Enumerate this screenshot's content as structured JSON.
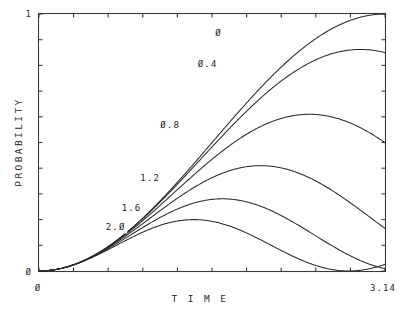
{
  "chart_data": {
    "type": "line",
    "title": "",
    "xlabel": "T I M E",
    "ylabel": "PROBABILITY",
    "xlim": [
      0,
      3.14
    ],
    "ylim": [
      0,
      1
    ],
    "x_tick_labels": [
      "Ø",
      "3.14"
    ],
    "y_tick_labels": [
      "Ø",
      "1"
    ],
    "x_minor_ticks": 10,
    "y_minor_ticks": 10,
    "grid": false,
    "legend_position": "inline-curve-labels",
    "legend_entries": [
      "Ø",
      "Ø.4",
      "Ø.8",
      "1.2",
      "1.6",
      "2.Ø"
    ],
    "series": [
      {
        "name": "Ø",
        "label": "Ø",
        "detuning": 0,
        "amplitude": 1.0,
        "generalized_rabi": 1.0,
        "peak_value": 1.0,
        "peak_time": 1.571,
        "label_x": 1.63,
        "label_y": 0.915
      },
      {
        "name": "Ø.4",
        "label": "Ø.4",
        "detuning": 0.4,
        "amplitude": 0.862,
        "generalized_rabi": 1.077,
        "peak_value": 0.862,
        "peak_time": 1.458,
        "label_x": 1.53,
        "label_y": 0.795
      },
      {
        "name": "Ø.8",
        "label": "Ø.8",
        "detuning": 0.8,
        "amplitude": 0.61,
        "generalized_rabi": 1.281,
        "peak_value": 0.61,
        "peak_time": 1.226,
        "label_x": 1.19,
        "label_y": 0.555
      },
      {
        "name": "1.2",
        "label": "1.2",
        "detuning": 1.2,
        "amplitude": 0.41,
        "generalized_rabi": 1.562,
        "peak_value": 0.41,
        "peak_time": 1.005,
        "label_x": 1.01,
        "label_y": 0.352
      },
      {
        "name": "1.6",
        "label": "1.6",
        "detuning": 1.6,
        "amplitude": 0.281,
        "generalized_rabi": 1.887,
        "peak_value": 0.281,
        "peak_time": 0.832,
        "label_x": 0.84,
        "label_y": 0.232
      },
      {
        "name": "2.Ø",
        "label": "2.Ø",
        "detuning": 2.0,
        "amplitude": 0.2,
        "generalized_rabi": 2.236,
        "peak_value": 0.2,
        "peak_time": 0.702,
        "label_x": 0.695,
        "label_y": 0.158
      }
    ]
  },
  "axes": {
    "y_label": "PROBABILITY",
    "x_label": "T I M E",
    "y_top_tick": "1",
    "y_bottom_tick": "Ø",
    "x_left_tick": "Ø",
    "x_right_tick": "3.14"
  },
  "colors": {
    "background": "#ffffff",
    "axis": "#3a3a3a",
    "curve": "#2b2b2b",
    "text": "#2a2a2a"
  }
}
